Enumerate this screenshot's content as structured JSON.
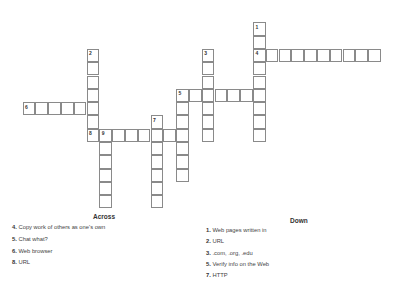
{
  "grid": {
    "origin_x": 22.5,
    "origin_y": 22.3,
    "cell_w": 12.8,
    "cell_h": 13.3,
    "words": [
      {
        "number": 1,
        "direction": "down",
        "col": 18,
        "row": 0,
        "length": 9
      },
      {
        "number": 2,
        "direction": "down",
        "col": 5,
        "row": 2,
        "length": 7
      },
      {
        "number": 3,
        "direction": "down",
        "col": 14,
        "row": 2,
        "length": 7
      },
      {
        "number": 4,
        "direction": "across",
        "col": 18,
        "row": 2,
        "length": 10
      },
      {
        "number": 5,
        "direction": "across",
        "col": 12,
        "row": 5,
        "length": 7
      },
      {
        "number": 5,
        "direction": "down",
        "col": 12,
        "row": 5,
        "length": 7
      },
      {
        "number": 6,
        "direction": "across",
        "col": 0,
        "row": 6,
        "length": 6
      },
      {
        "number": 7,
        "direction": "down",
        "col": 10,
        "row": 7,
        "length": 7
      },
      {
        "number": 8,
        "direction": "across",
        "col": 5,
        "row": 8,
        "length": 8
      },
      {
        "number": 9,
        "direction": "down",
        "col": 6,
        "row": 8,
        "length": 6
      }
    ]
  },
  "across": {
    "title": "Across",
    "clues": [
      {
        "num": "4.",
        "text": "Copy work of others as one's own"
      },
      {
        "num": "5.",
        "text": "Chat what?"
      },
      {
        "num": "6.",
        "text": "Web browser"
      },
      {
        "num": "8.",
        "text": "URL"
      }
    ]
  },
  "down": {
    "title": "Down",
    "clues": [
      {
        "num": "1.",
        "text": "Web pages written in"
      },
      {
        "num": "2.",
        "text": "URL"
      },
      {
        "num": "3.",
        "text": ".com, .org, .edu"
      },
      {
        "num": "5.",
        "text": "Verify info on the Web"
      },
      {
        "num": "7.",
        "text": "HTTP"
      }
    ]
  }
}
